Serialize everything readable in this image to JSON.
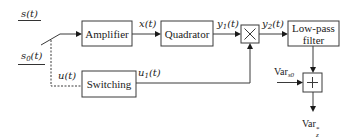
{
  "diagram": {
    "inputs": {
      "signal": "s(t)",
      "signal_base": "s",
      "reference": "s0(t)",
      "reference_base": "s",
      "reference_sub": "0",
      "arg": "(t)"
    },
    "blocks": {
      "amplifier": "Amplifier",
      "quadrator": "Quadrator",
      "multiplier": "×",
      "lowpass_line1": "Low-pass",
      "lowpass_line2": "filter",
      "switching": "Switching",
      "adder": "+"
    },
    "signals": {
      "x": {
        "base": "x",
        "arg": "(t)"
      },
      "y1": {
        "base": "y",
        "sub": "1",
        "arg": "(t)"
      },
      "y2": {
        "base": "y",
        "sub": "2",
        "arg": "(t)"
      },
      "u": {
        "base": "u",
        "arg": "(t)"
      },
      "u1": {
        "base": "u",
        "sub": "1",
        "arg": "(t)"
      }
    },
    "variance_in": {
      "base": "Var",
      "sub": "s0"
    },
    "variance_out": {
      "base": "Var",
      "sub": "z",
      "sup": "*"
    },
    "colors": {
      "line": "#3a3a3a",
      "text": "#222222",
      "background": "#ffffff"
    }
  }
}
